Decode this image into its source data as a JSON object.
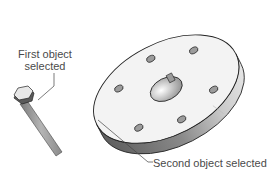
{
  "diagram": {
    "objects": [
      {
        "id": "bolt",
        "description": "hex bolt"
      },
      {
        "id": "flange",
        "description": "circular flange disc with center keyed bore and six bolt holes"
      }
    ],
    "callouts": {
      "first": {
        "line1": "First object",
        "line2": "selected"
      },
      "second": {
        "text": "Second object selected"
      }
    },
    "colors": {
      "outline": "#222222",
      "face": "#f2f2f2",
      "side_dark": "#6a6a6a",
      "side_light": "#d8d8d8",
      "text": "#4a4a4a"
    }
  }
}
